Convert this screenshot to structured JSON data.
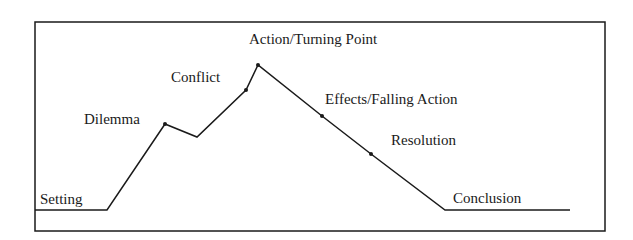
{
  "diagram": {
    "type": "plot-structure-line",
    "stages": [
      {
        "label": "Setting",
        "label_x": 40,
        "label_y": 204
      },
      {
        "label": "Dilemma",
        "label_x": 84,
        "label_y": 124
      },
      {
        "label": "Conflict",
        "label_x": 171,
        "label_y": 82
      },
      {
        "label": "Action/Turning Point",
        "label_x": 249,
        "label_y": 44
      },
      {
        "label": "Effects/Falling Action",
        "label_x": 325,
        "label_y": 104
      },
      {
        "label": "Resolution",
        "label_x": 391,
        "label_y": 145
      },
      {
        "label": "Conclusion",
        "label_x": 453,
        "label_y": 203
      }
    ],
    "line_points": [
      [
        35,
        210
      ],
      [
        107,
        210
      ],
      [
        165,
        124
      ],
      [
        197,
        137
      ],
      [
        246,
        90
      ],
      [
        258,
        65
      ],
      [
        322,
        116
      ],
      [
        371,
        154
      ],
      [
        445,
        210
      ],
      [
        570,
        210
      ]
    ],
    "dots": [
      [
        165,
        124
      ],
      [
        246,
        90
      ],
      [
        258,
        65
      ],
      [
        322,
        116
      ],
      [
        371,
        154
      ]
    ],
    "frame": {
      "x": 35,
      "y": 22,
      "width": 570,
      "height": 209
    },
    "colors": {
      "line": "#1a1a1a",
      "background": "#ffffff"
    }
  }
}
